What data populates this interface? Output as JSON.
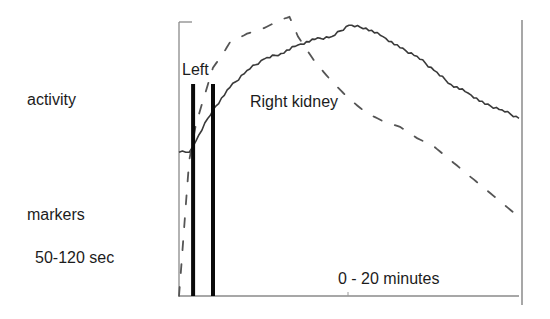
{
  "labels": {
    "y_axis": "activity",
    "markers_title": "markers",
    "markers_window": "50-120 sec",
    "left_series": "Left",
    "right_series": "Right kidney",
    "x_axis": "0 - 20 minutes"
  },
  "colors": {
    "axis": "#8a8a8a",
    "solid_curve": "#3a3a3a",
    "dashed_curve": "#555555",
    "marker": "#0a0a0a",
    "text": "#1c1c1c"
  },
  "chart_data": {
    "type": "line",
    "title": "",
    "xlabel": "0 - 20 minutes",
    "ylabel": "activity",
    "xlim": [
      0,
      20
    ],
    "ylim": [
      0,
      1
    ],
    "grid": false,
    "x_units": "minutes",
    "annotations": [
      {
        "text": "Left",
        "target": "dashed series"
      },
      {
        "text": "Right kidney",
        "target": "solid series"
      },
      {
        "text": "markers 50-120 sec",
        "type": "vertical_lines",
        "x_seconds": [
          50,
          120
        ]
      }
    ],
    "markers": [
      {
        "x_min": 0.83,
        "label": "50 sec"
      },
      {
        "x_min": 2.0,
        "label": "120 sec"
      }
    ],
    "series": [
      {
        "name": "Right kidney",
        "style": "solid",
        "x": [
          0,
          0.6,
          1.0,
          1.7,
          2.0,
          3.0,
          4.0,
          5.0,
          6.0,
          7.0,
          8.0,
          9.0,
          10.0,
          11.0,
          12.0,
          13.0,
          14.0,
          15.0,
          16.0,
          17.0,
          18.0,
          19.0,
          20.0
        ],
        "values": [
          0.51,
          0.51,
          0.55,
          0.63,
          0.66,
          0.74,
          0.8,
          0.84,
          0.86,
          0.89,
          0.91,
          0.92,
          0.96,
          0.95,
          0.92,
          0.88,
          0.85,
          0.8,
          0.75,
          0.72,
          0.68,
          0.66,
          0.63
        ]
      },
      {
        "name": "Left kidney",
        "style": "dashed",
        "x": [
          0,
          0.3,
          0.6,
          1.0,
          1.7,
          2.0,
          2.6,
          3.0,
          4.0,
          5.0,
          6.0,
          6.5,
          7.0,
          8.0,
          9.0,
          10.0,
          11.0,
          12.0,
          13.0,
          14.0,
          15.0,
          16.0,
          17.0,
          18.0,
          19.0,
          20.0
        ],
        "values": [
          0.0,
          0.24,
          0.48,
          0.61,
          0.75,
          0.81,
          0.86,
          0.9,
          0.93,
          0.95,
          0.98,
          0.99,
          0.92,
          0.83,
          0.76,
          0.7,
          0.65,
          0.62,
          0.6,
          0.56,
          0.53,
          0.48,
          0.43,
          0.38,
          0.33,
          0.28
        ]
      }
    ]
  }
}
